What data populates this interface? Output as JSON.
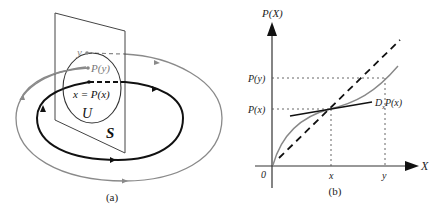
{
  "panel_a": {
    "caption": "(a)",
    "labels": {
      "y": "y",
      "p_y": "P(y)",
      "x_eq": "x = P(x)",
      "u": "U",
      "s": "S"
    },
    "colors": {
      "periodic_orbit": "#111111",
      "nearby_orbit": "#888888",
      "section": "#444444"
    }
  },
  "panel_b": {
    "caption": "(b)",
    "axis": {
      "y_label": "P(X)",
      "x_label": "X",
      "origin": "0",
      "x_ticks": [
        "x",
        "y"
      ],
      "y_ticks": [
        "P(x)",
        "P(y)"
      ]
    },
    "annotations": {
      "derivative": "D",
      "derivative_sub": "x",
      "derivative_tail": "P(x)"
    }
  }
}
